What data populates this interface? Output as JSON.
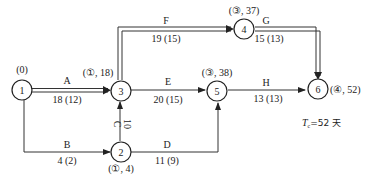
{
  "diagram": {
    "type": "activity-on-arrow network (critical path)",
    "nodes": [
      {
        "id": "1",
        "label": "1",
        "annotation": "(0)"
      },
      {
        "id": "2",
        "label": "2",
        "annotation": "(①, 4)"
      },
      {
        "id": "3",
        "label": "3",
        "annotation": "(①, 18)"
      },
      {
        "id": "4",
        "label": "4",
        "annotation": "(③, 37)"
      },
      {
        "id": "5",
        "label": "5",
        "annotation": "(③, 38)"
      },
      {
        "id": "6",
        "label": "6",
        "annotation": "(④, 52)"
      }
    ],
    "edges": [
      {
        "name": "A",
        "from": "1",
        "to": "3",
        "duration": "18 (12)",
        "critical": true
      },
      {
        "name": "B",
        "from": "1",
        "to": "2",
        "duration": "4 (2)",
        "critical": false
      },
      {
        "name": "C",
        "from": "2",
        "to": "3",
        "duration": "10",
        "critical": false
      },
      {
        "name": "D",
        "from": "2",
        "to": "5",
        "duration": "11 (9)",
        "critical": false
      },
      {
        "name": "E",
        "from": "3",
        "to": "5",
        "duration": "20 (15)",
        "critical": false
      },
      {
        "name": "F",
        "from": "3",
        "to": "4",
        "duration": "19 (15)",
        "critical": true
      },
      {
        "name": "G",
        "from": "4",
        "to": "6",
        "duration": "15 (13)",
        "critical": true
      },
      {
        "name": "H",
        "from": "5",
        "to": "6",
        "duration": "13 (13)",
        "critical": false
      }
    ],
    "total_duration": {
      "symbol": "T",
      "subscript": "c",
      "text": "=52 天"
    }
  }
}
